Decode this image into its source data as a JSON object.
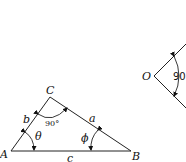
{
  "figure": {
    "triangle": {
      "vertices": {
        "A": "A",
        "B": "B",
        "C": "C"
      },
      "sides": {
        "a": "a",
        "b": "b",
        "c": "c"
      },
      "angles": {
        "theta": "θ",
        "phi": "ϕ",
        "right": "90°"
      }
    },
    "right_angle": {
      "vertex": "O",
      "angle": "90"
    }
  }
}
